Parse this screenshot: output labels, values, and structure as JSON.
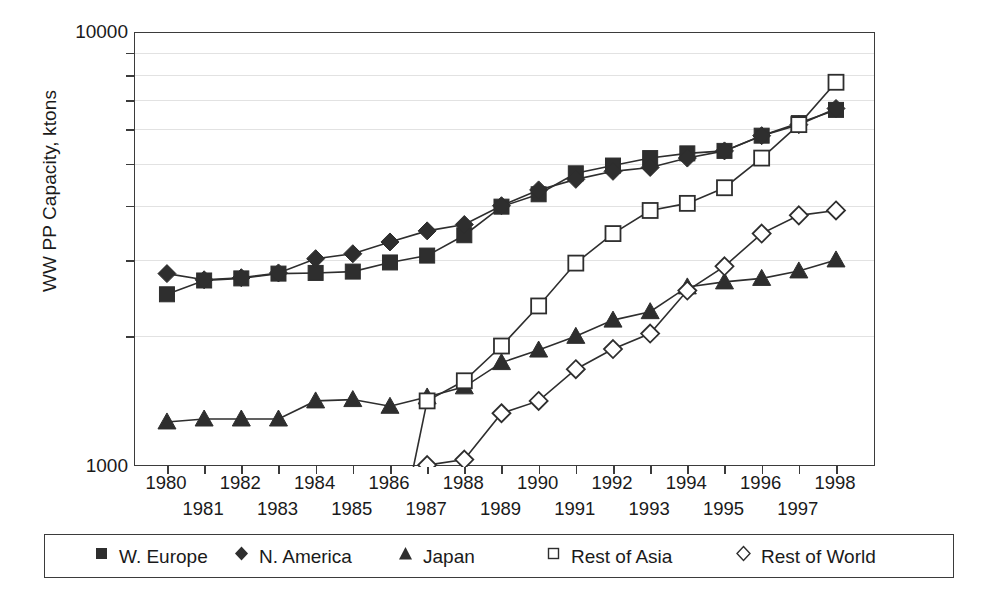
{
  "chart_data": {
    "type": "line",
    "title": "",
    "xlabel": "",
    "ylabel": "WW PP Capacity, ktons",
    "yscale": "log",
    "ylim": [
      1000,
      10000
    ],
    "ytick_labels": [
      "10000",
      "1000"
    ],
    "yminor_ticks": [
      2000,
      3000,
      4000,
      5000,
      6000,
      7000,
      8000,
      9000
    ],
    "grid": true,
    "legend_position": "bottom",
    "x": [
      1980,
      1981,
      1982,
      1983,
      1984,
      1985,
      1986,
      1987,
      1988,
      1989,
      1990,
      1991,
      1992,
      1993,
      1994,
      1995,
      1996,
      1997,
      1998
    ],
    "categories": [
      "1980",
      "1981",
      "1982",
      "1983",
      "1984",
      "1985",
      "1986",
      "1987",
      "1988",
      "1989",
      "1990",
      "1991",
      "1992",
      "1993",
      "1994",
      "1995",
      "1996",
      "1997",
      "1998"
    ],
    "series": [
      {
        "name": "W. Europe",
        "marker": "filled-square",
        "color": "#2e2e2e",
        "values": [
          2500,
          2690,
          2720,
          2790,
          2800,
          2820,
          2960,
          3070,
          3420,
          3980,
          4250,
          4750,
          4950,
          5150,
          5280,
          5350,
          5800,
          6200,
          6650
        ]
      },
      {
        "name": "N. America",
        "marker": "filled-diamond",
        "color": "#2e2e2e",
        "values": [
          2790,
          2700,
          2730,
          2800,
          3020,
          3100,
          3300,
          3500,
          3620,
          4000,
          4350,
          4600,
          4800,
          4900,
          5150,
          5350,
          5800,
          6150,
          6700
        ]
      },
      {
        "name": "Japan",
        "marker": "filled-triangle",
        "color": "#2e2e2e",
        "values": [
          1270,
          1290,
          1290,
          1290,
          1420,
          1430,
          1380,
          1450,
          1530,
          1740,
          1860,
          2000,
          2180,
          2280,
          2600,
          2670,
          2720,
          2830,
          3000
        ]
      },
      {
        "name": "Rest of Asia",
        "marker": "open-square",
        "color": "#2e2e2e",
        "values": [
          null,
          null,
          null,
          null,
          null,
          null,
          null,
          1420,
          1580,
          1900,
          2350,
          2950,
          3450,
          3900,
          4050,
          4400,
          5150,
          6150,
          7700
        ]
      },
      {
        "name": "Rest of World",
        "marker": "open-diamond",
        "color": "#2e2e2e",
        "values": [
          null,
          null,
          null,
          null,
          null,
          null,
          null,
          1010,
          1040,
          1330,
          1420,
          1680,
          1870,
          2030,
          2550,
          2900,
          3450,
          3800,
          3900
        ]
      }
    ]
  },
  "legend": {
    "items": [
      {
        "label": "W. Europe",
        "marker": "filled-square"
      },
      {
        "label": "N. America",
        "marker": "filled-diamond"
      },
      {
        "label": "Japan",
        "marker": "filled-triangle"
      },
      {
        "label": "Rest of Asia",
        "marker": "open-square"
      },
      {
        "label": "Rest of World",
        "marker": "open-diamond"
      }
    ]
  }
}
